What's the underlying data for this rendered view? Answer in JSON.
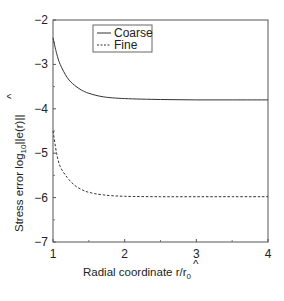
{
  "chart_data": {
    "type": "line",
    "title": "",
    "xlabel": "Radial coordinate r̂/r0",
    "ylabel": "Stress error log10||e(r̂)||",
    "xlim": [
      1,
      4
    ],
    "ylim": [
      -7,
      -2
    ],
    "x_ticks": [
      "1",
      "2",
      "3",
      "4"
    ],
    "y_ticks": [
      "-2",
      "-3",
      "-4",
      "-5",
      "-6",
      "-7"
    ],
    "grid": false,
    "legend_position": "upper left inside",
    "series": [
      {
        "name": "Coarse",
        "style": "solid",
        "x": [
          1.0,
          1.05,
          1.1,
          1.2,
          1.3,
          1.4,
          1.5,
          1.7,
          2.0,
          2.5,
          3.0,
          3.5,
          4.0
        ],
        "y": [
          -2.4,
          -2.75,
          -3.0,
          -3.3,
          -3.47,
          -3.58,
          -3.65,
          -3.73,
          -3.77,
          -3.79,
          -3.8,
          -3.8,
          -3.8
        ]
      },
      {
        "name": "Fine",
        "style": "dashed",
        "x": [
          1.0,
          1.05,
          1.1,
          1.2,
          1.3,
          1.4,
          1.5,
          1.7,
          2.0,
          2.5,
          3.0,
          3.5,
          4.0
        ],
        "y": [
          -4.5,
          -5.0,
          -5.3,
          -5.55,
          -5.72,
          -5.82,
          -5.88,
          -5.94,
          -5.97,
          -5.98,
          -5.98,
          -5.98,
          -5.98
        ]
      }
    ]
  },
  "axes": {
    "x_label_main": "Radial coordinate ",
    "x_label_var": "r",
    "x_label_hat": "^",
    "x_label_div": "/r",
    "x_label_sub": "0",
    "y_label_main": "Stress error log",
    "y_label_sub": "10",
    "y_label_rest": "||e(",
    "y_label_var": "r",
    "y_label_hat": "^",
    "y_label_end": ")||"
  },
  "legend": {
    "items": [
      {
        "label": "Coarse",
        "style": "solid"
      },
      {
        "label": "Fine",
        "style": "dashed"
      }
    ]
  },
  "colors": {
    "line": "#333333",
    "frame": "#555555"
  }
}
